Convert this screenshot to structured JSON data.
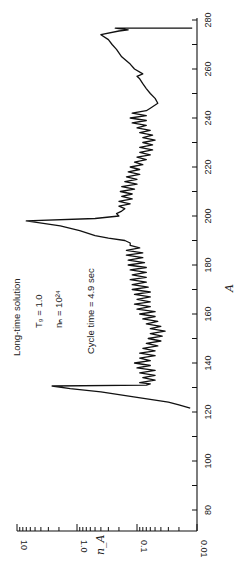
{
  "chart_data": {
    "type": "line",
    "orientation": "rotated-90-ccw",
    "title": "",
    "xlabel": "A",
    "ylabel": "n_A",
    "xlim": [
      70,
      280
    ],
    "ylim": [
      0.01,
      10
    ],
    "yscale": "log",
    "xticks": [
      80,
      100,
      120,
      140,
      160,
      180,
      200,
      220,
      240,
      260,
      280
    ],
    "xtick_labels": [
      "80",
      "100",
      "120",
      "140",
      "160",
      "180",
      "200",
      "220",
      "240",
      "260",
      "280"
    ],
    "yticks": [
      10,
      1.0,
      0.1,
      0.01
    ],
    "ytick_labels": [
      "10",
      "1.0",
      "0.1",
      "0.01"
    ],
    "grid": false,
    "annotations": [
      "Long-time solution",
      "T₉ = 1.0",
      "nₙ = 10²⁴",
      "Cycle time = 4.9 sec"
    ],
    "series": [
      {
        "name": "n_A (long-time solution)",
        "points": [
          [
            121.6,
            0.013
          ],
          [
            122.9,
            0.02
          ],
          [
            124,
            0.03
          ],
          [
            126,
            0.1
          ],
          [
            128.2,
            0.4
          ],
          [
            129.5,
            1.3
          ],
          [
            130.6,
            2.6
          ],
          [
            131,
            0.07
          ],
          [
            131.5,
            0.06
          ],
          [
            132,
            0.09
          ],
          [
            133,
            0.05
          ],
          [
            134,
            0.08
          ],
          [
            135,
            0.05
          ],
          [
            136,
            0.09
          ],
          [
            137,
            0.05
          ],
          [
            138,
            0.1
          ],
          [
            139,
            0.06
          ],
          [
            140,
            0.11
          ],
          [
            141,
            0.06
          ],
          [
            142,
            0.09
          ],
          [
            143,
            0.05
          ],
          [
            144,
            0.09
          ],
          [
            145,
            0.05
          ],
          [
            146,
            0.08
          ],
          [
            147,
            0.045
          ],
          [
            148,
            0.07
          ],
          [
            149,
            0.04
          ],
          [
            150,
            0.065
          ],
          [
            151,
            0.038
          ],
          [
            152,
            0.06
          ],
          [
            153,
            0.034
          ],
          [
            154,
            0.06
          ],
          [
            155,
            0.04
          ],
          [
            156,
            0.07
          ],
          [
            157,
            0.045
          ],
          [
            158,
            0.08
          ],
          [
            159,
            0.05
          ],
          [
            160,
            0.09
          ],
          [
            161,
            0.05
          ],
          [
            162,
            0.1
          ],
          [
            163,
            0.06
          ],
          [
            164,
            0.11
          ],
          [
            165,
            0.06
          ],
          [
            166,
            0.1
          ],
          [
            167,
            0.06
          ],
          [
            168,
            0.11
          ],
          [
            169,
            0.06
          ],
          [
            170,
            0.12
          ],
          [
            171,
            0.065
          ],
          [
            172,
            0.12
          ],
          [
            173,
            0.07
          ],
          [
            174,
            0.13
          ],
          [
            175,
            0.07
          ],
          [
            176,
            0.12
          ],
          [
            177,
            0.07
          ],
          [
            178,
            0.13
          ],
          [
            179,
            0.07
          ],
          [
            180,
            0.14
          ],
          [
            181,
            0.075
          ],
          [
            182,
            0.14
          ],
          [
            183,
            0.08
          ],
          [
            184,
            0.15
          ],
          [
            185,
            0.08
          ],
          [
            186,
            0.15
          ],
          [
            187,
            0.09
          ],
          [
            188,
            0.13
          ],
          [
            189,
            0.13
          ],
          [
            190,
            0.16
          ],
          [
            191,
            0.3
          ],
          [
            192,
            0.5
          ],
          [
            194,
            0.9
          ],
          [
            196,
            1.9
          ],
          [
            198,
            7.0
          ],
          [
            199,
            0.5
          ],
          [
            200,
            0.2
          ],
          [
            201,
            0.22
          ],
          [
            202,
            0.18
          ],
          [
            203,
            0.16
          ],
          [
            204,
            0.2
          ],
          [
            205,
            0.13
          ],
          [
            206,
            0.2
          ],
          [
            207,
            0.12
          ],
          [
            208,
            0.18
          ],
          [
            209,
            0.12
          ],
          [
            210,
            0.19
          ],
          [
            211,
            0.11
          ],
          [
            212,
            0.18
          ],
          [
            213,
            0.1
          ],
          [
            214,
            0.16
          ],
          [
            215,
            0.1
          ],
          [
            216,
            0.15
          ],
          [
            217,
            0.09
          ],
          [
            218,
            0.14
          ],
          [
            219,
            0.09
          ],
          [
            220,
            0.13
          ],
          [
            221,
            0.08
          ],
          [
            222,
            0.11
          ],
          [
            223,
            0.07
          ],
          [
            224,
            0.1
          ],
          [
            225,
            0.06
          ],
          [
            226,
            0.09
          ],
          [
            227,
            0.055
          ],
          [
            228,
            0.09
          ],
          [
            229,
            0.055
          ],
          [
            230,
            0.08
          ],
          [
            231,
            0.05
          ],
          [
            232,
            0.08
          ],
          [
            233,
            0.055
          ],
          [
            234,
            0.09
          ],
          [
            235,
            0.06
          ],
          [
            236,
            0.1
          ],
          [
            237,
            0.07
          ],
          [
            238,
            0.12
          ],
          [
            239,
            0.07
          ],
          [
            240,
            0.13
          ],
          [
            241,
            0.07
          ],
          [
            242,
            0.12
          ],
          [
            243,
            0.07
          ],
          [
            244,
            0.06
          ],
          [
            246,
            0.045
          ],
          [
            248,
            0.05
          ],
          [
            250,
            0.06
          ],
          [
            252,
            0.07
          ],
          [
            254,
            0.08
          ],
          [
            256,
            0.09
          ],
          [
            257,
            0.1
          ],
          [
            258,
            0.08
          ],
          [
            260,
            0.11
          ],
          [
            262,
            0.13
          ],
          [
            265,
            0.18
          ],
          [
            268,
            0.22
          ],
          [
            270,
            0.26
          ],
          [
            272,
            0.3
          ],
          [
            274,
            0.4
          ],
          [
            275.5,
            0.2
          ],
          [
            276,
            0.14
          ],
          [
            276.7,
            0.23
          ],
          [
            276.7,
            0.012
          ]
        ]
      }
    ]
  }
}
